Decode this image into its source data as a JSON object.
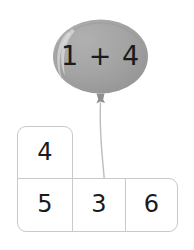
{
  "canvas": {
    "width": 194,
    "height": 250,
    "background": "#ffffff"
  },
  "balloon": {
    "name": "balloon",
    "equation": "1 + 4",
    "addend_left": "1",
    "operator": "+",
    "addend_right": "4",
    "answer_hint": "5",
    "fill_color": "#a3a3a3",
    "shade_color": "#989898",
    "highlight_color": "#c4c4c4",
    "text_color": "#1b1b1b",
    "string_color": "#b5b5b5",
    "knot_color": "#8f8f8f"
  },
  "answer_grid": {
    "name": "number-choice-grid",
    "border_color": "#c9c9c9",
    "cell_background": "#ffffff",
    "text_color": "#1b1b1b",
    "top_row": [
      {
        "value": "4"
      }
    ],
    "bottom_row": [
      {
        "value": "5"
      },
      {
        "value": "3"
      },
      {
        "value": "6"
      }
    ]
  }
}
